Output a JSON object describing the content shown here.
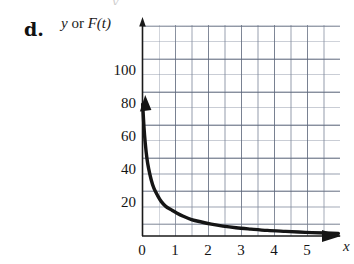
{
  "figure": {
    "part_label": "d.",
    "top_remnant": "y",
    "y_axis_caption_var": "y",
    "y_axis_caption_conj": " or ",
    "y_axis_caption_func": "F(t)",
    "x_axis_caption": "x"
  },
  "chart_data": {
    "type": "line",
    "title": "",
    "subtitle": "",
    "xlabel": "x",
    "ylabel": "y or F(t)",
    "annotations": [
      "d."
    ],
    "legend": [],
    "legend_position": "none",
    "grid": true,
    "grid_major_step_x": 1,
    "grid_major_step_y": 20,
    "grid_minor_step_x": 0.5,
    "grid_minor_step_y": 10,
    "xlim": [
      0,
      6
    ],
    "ylim": [
      0,
      128
    ],
    "xticks": [
      0,
      1,
      2,
      3,
      4,
      5
    ],
    "xticklabels": [
      "0",
      "1",
      "2",
      "3",
      "4",
      "5"
    ],
    "yticks": [
      20,
      40,
      60,
      80,
      100
    ],
    "yticklabels": [
      "20",
      "40",
      "60",
      "80",
      "100"
    ],
    "axis_arrows": {
      "x": "right",
      "y": "up"
    },
    "curve_arrow_start": "up",
    "curve_arrow_end": "right",
    "series": [
      {
        "name": "decay",
        "description": "decreasing exponential-like decay from about 80 at x=0 toward 0",
        "x": [
          0.02,
          0.06,
          0.1,
          0.15,
          0.2,
          0.28,
          0.36,
          0.46,
          0.58,
          0.72,
          0.88,
          1.05,
          1.25,
          1.5,
          1.8,
          2.1,
          2.45,
          2.85,
          3.3,
          3.8,
          4.35,
          4.95,
          5.55,
          5.95
        ],
        "y": [
          80,
          66,
          56,
          47,
          41,
          34,
          29,
          25,
          21,
          18,
          16,
          14,
          12,
          10,
          8.5,
          7.2,
          6.0,
          5.0,
          4.2,
          3.4,
          2.8,
          2.2,
          1.8,
          1.5
        ]
      }
    ]
  }
}
